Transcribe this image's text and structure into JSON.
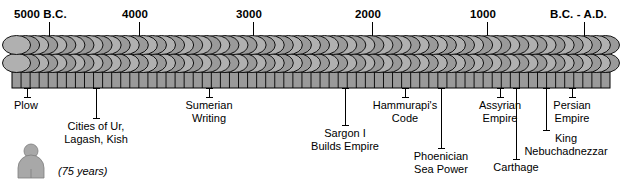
{
  "figure": {
    "type": "timeline",
    "orientation": "horizontal"
  },
  "colors": {
    "disc_fill": "#9a9a9a",
    "disc_fill_light": "#b0b0b0",
    "disc_fill_dark": "#8a8a8a",
    "outline": "#000000",
    "legend_figure": "#a8a8a8",
    "background": "#ffffff"
  },
  "axis": {
    "ticks": [
      {
        "label": "5000 B.C.",
        "x": 49,
        "label_x": 14,
        "label_align": "left"
      },
      {
        "label": "4000",
        "x": 139,
        "label_x": 122,
        "label_align": "left"
      },
      {
        "label": "3000",
        "x": 253,
        "label_x": 236,
        "label_align": "left"
      },
      {
        "label": "2000",
        "x": 372,
        "label_x": 355,
        "label_align": "left"
      },
      {
        "label": "1000",
        "x": 487,
        "label_x": 470,
        "label_align": "left"
      },
      {
        "label": "B.C. - A.D.",
        "x": 584,
        "label_x": 550,
        "label_align": "left"
      }
    ],
    "tick_top": 22,
    "tick_bottom": 36,
    "label_y": 8
  },
  "band": {
    "left": 12,
    "right": 610,
    "disc_count": 66,
    "row_top_y": 36,
    "row_mid_y": 54,
    "row_bottom_y": 72,
    "row_bottom_height": 16
  },
  "events": [
    {
      "name": "plow",
      "lines": [
        "Plow"
      ],
      "anchor_x": 27,
      "leader_top": 88,
      "leader_bottom": 98,
      "text_x": 14,
      "text_y": 99,
      "align": "left"
    },
    {
      "name": "cities-of-ur-lagash-kish",
      "lines": [
        "Cities of Ur,",
        "Lagash, Kish"
      ],
      "anchor_x": 96,
      "leader_top": 88,
      "leader_bottom": 119,
      "text_x": 96,
      "text_y": 120,
      "align": "center"
    },
    {
      "name": "sumerian-writing",
      "lines": [
        "Sumerian",
        "Writing"
      ],
      "anchor_x": 209,
      "leader_top": 88,
      "leader_bottom": 98,
      "text_x": 209,
      "text_y": 99,
      "align": "center"
    },
    {
      "name": "sargon-i-builds-empire",
      "lines": [
        "Sargon I",
        "Builds Empire"
      ],
      "anchor_x": 345,
      "leader_top": 88,
      "leader_bottom": 126,
      "text_x": 345,
      "text_y": 127,
      "align": "center"
    },
    {
      "name": "hammurapis-code",
      "lines": [
        "Hammurapi's",
        "Code"
      ],
      "anchor_x": 405,
      "leader_top": 88,
      "leader_bottom": 98,
      "text_x": 405,
      "text_y": 99,
      "align": "center"
    },
    {
      "name": "phoenician-sea-power",
      "lines": [
        "Phoenician",
        "Sea Power"
      ],
      "anchor_x": 441,
      "leader_top": 88,
      "leader_bottom": 149,
      "text_x": 441,
      "text_y": 150,
      "align": "center"
    },
    {
      "name": "assyrian-empire",
      "lines": [
        "Assyrian",
        "Empire"
      ],
      "anchor_x": 500,
      "leader_top": 88,
      "leader_bottom": 98,
      "text_x": 500,
      "text_y": 99,
      "align": "center"
    },
    {
      "name": "carthage",
      "lines": [
        "Carthage"
      ],
      "anchor_x": 516,
      "leader_top": 88,
      "leader_bottom": 160,
      "text_x": 516,
      "text_y": 161,
      "align": "center"
    },
    {
      "name": "king-nebuchadnezzar",
      "lines": [
        "King",
        "Nebuchadnezzar"
      ],
      "anchor_x": 546,
      "leader_top": 88,
      "leader_bottom": 131,
      "text_x": 566,
      "text_y": 132,
      "align": "center"
    },
    {
      "name": "persian-empire",
      "lines": [
        "Persian",
        "Empire"
      ],
      "anchor_x": 572,
      "leader_top": 88,
      "leader_bottom": 98,
      "text_x": 572,
      "text_y": 99,
      "align": "center"
    }
  ],
  "legend": {
    "icon_name": "person-figure-icon",
    "caption": "(75 years)",
    "icon_x": 14,
    "icon_y": 142,
    "text_x": 58,
    "text_y": 165
  }
}
